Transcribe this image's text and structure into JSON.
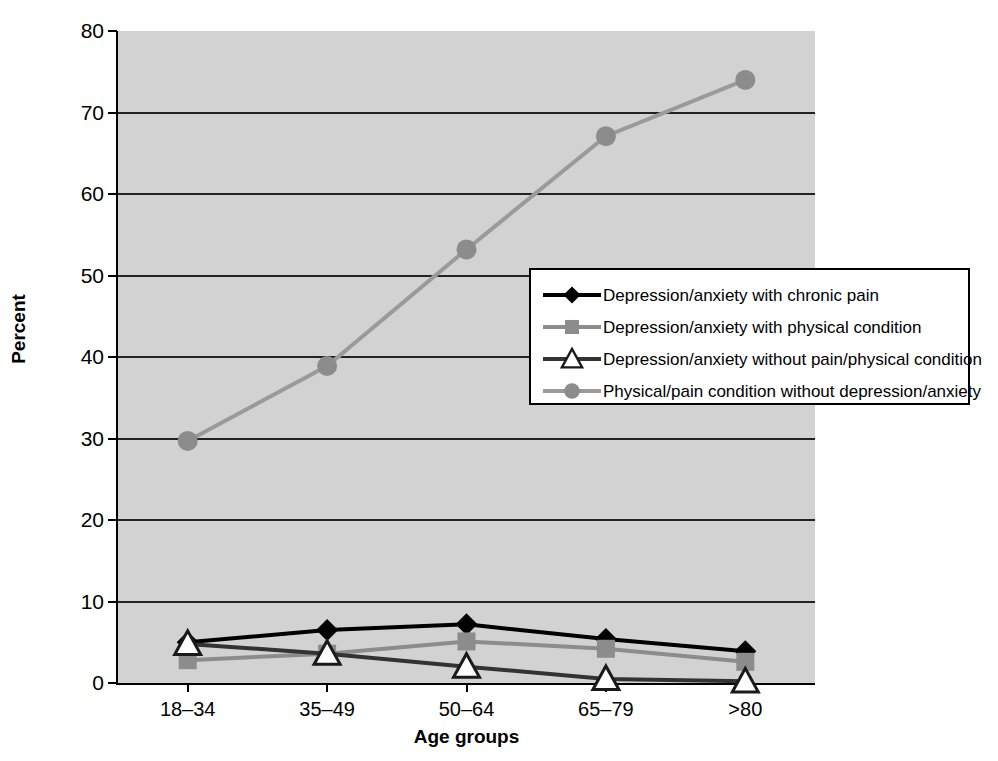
{
  "chart_data": {
    "type": "line",
    "title": "",
    "xlabel": "Age groups",
    "ylabel": "Percent",
    "categories": [
      "18–34",
      "35–49",
      "50–64",
      "65–79",
      ">80"
    ],
    "ylim": [
      0,
      80
    ],
    "yticks": [
      0,
      10,
      20,
      30,
      40,
      50,
      60,
      70,
      80
    ],
    "grid": true,
    "legend_position": "center-right",
    "series": [
      {
        "name": "Depression/anxiety with chronic pain",
        "values": [
          5.0,
          6.5,
          7.2,
          5.4,
          3.9
        ],
        "marker": "diamond",
        "marker_fill": "#000000",
        "line_color": "#000000"
      },
      {
        "name": "Depression/anxiety with physical condition",
        "values": [
          2.8,
          3.6,
          5.1,
          4.2,
          2.6
        ],
        "marker": "square",
        "marker_fill": "#8c8c8c",
        "line_color": "#8c8c8c"
      },
      {
        "name": "Depression/anxiety without pain/physical condition",
        "values": [
          4.8,
          3.6,
          2.0,
          0.5,
          0.2
        ],
        "marker": "triangle",
        "marker_fill": "#ffffff",
        "line_color": "#333333"
      },
      {
        "name": "Physical/pain condition without depression/anxiety",
        "values": [
          29.7,
          38.9,
          53.2,
          67.1,
          74.0
        ],
        "marker": "circle",
        "marker_fill": "#8c8c8c",
        "line_color": "#9a9a9a"
      }
    ]
  },
  "axes": {
    "y_tick_labels": [
      "80",
      "70",
      "60",
      "50",
      "40",
      "30",
      "20",
      "10",
      "0"
    ],
    "x_tick_labels": [
      "18–34",
      "35–49",
      "50–64",
      "65–79",
      ">80"
    ],
    "y_title": "Percent",
    "x_title": "Age groups"
  },
  "legend": {
    "items": [
      {
        "label": "Depression/anxiety with chronic pain",
        "marker": "diamond-marker-icon"
      },
      {
        "label": "Depression/anxiety with physical condition",
        "marker": "square-marker-icon"
      },
      {
        "label": "Depression/anxiety without pain/physical condition",
        "marker": "triangle-marker-icon"
      },
      {
        "label": "Physical/pain condition without depression/anxiety",
        "marker": "circle-marker-icon"
      }
    ]
  },
  "colors": {
    "plot_background": "#d2d2d2",
    "page_background": "#ffffff",
    "gridline": "#222222",
    "axis": "#000000",
    "series_black": "#000000",
    "series_gray": "#8c8c8c",
    "series_light_gray": "#9a9a9a",
    "series_dark": "#333333"
  }
}
